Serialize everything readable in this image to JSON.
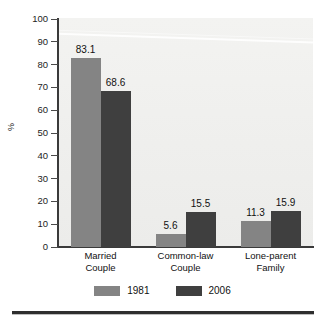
{
  "chart_data": {
    "type": "bar",
    "title": "",
    "subtitle": "",
    "xlabel": "",
    "ylabel": "%",
    "ylim": [
      0,
      100
    ],
    "ytick_step": 10,
    "yticks": [
      "100",
      "90",
      "80",
      "70",
      "60",
      "50",
      "40",
      "30",
      "20",
      "10",
      "0"
    ],
    "grid": false,
    "legend_position": "bottom-center",
    "categories": [
      "Married Couple",
      "Common-law Couple",
      "Lone-parent Family"
    ],
    "category_lines": [
      [
        "Married",
        "Couple"
      ],
      [
        "Common-law",
        "Couple"
      ],
      [
        "Lone-parent",
        "Family"
      ]
    ],
    "series": [
      {
        "name": "1981",
        "color": "#848484",
        "values": [
          83.1,
          5.6,
          11.3
        ],
        "labels": [
          "83.1",
          "5.6",
          "11.3"
        ]
      },
      {
        "name": "2006",
        "color": "#3f3f3f",
        "values": [
          68.6,
          15.5,
          15.9
        ],
        "labels": [
          "68.6",
          "15.5",
          "15.9"
        ]
      }
    ]
  },
  "figure": {
    "plot_background": "#efefed",
    "axis_color": "#3a3a3a",
    "rule_color": "#2e2e2e"
  },
  "legend": {
    "items": [
      {
        "label": "1981",
        "swatch": "legend-swatch-1981"
      },
      {
        "label": "2006",
        "swatch": "legend-swatch-2006"
      }
    ]
  }
}
